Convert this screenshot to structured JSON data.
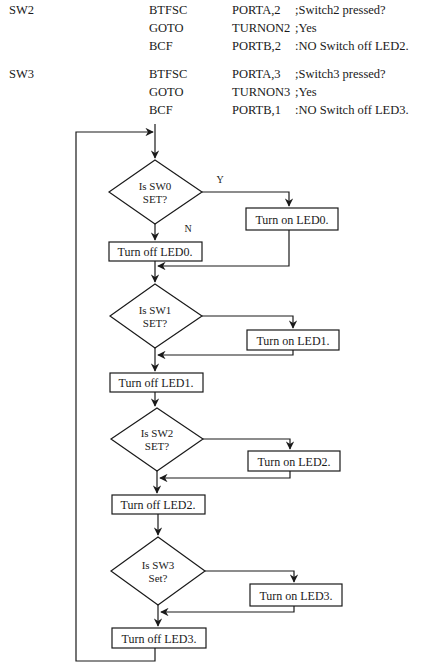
{
  "code": {
    "blocks": [
      {
        "label": "SW2",
        "lines": [
          {
            "op": "BTFSC",
            "arg": "PORTA,2",
            "comment": ";Switch2 pressed?"
          },
          {
            "op": "GOTO",
            "arg": "TURNON2",
            "comment": ";Yes"
          },
          {
            "op": "BCF",
            "arg": "PORTB,2",
            "comment": ":NO Switch off LED2."
          }
        ]
      },
      {
        "label": "SW3",
        "lines": [
          {
            "op": "BTFSC",
            "arg": "PORTA,3",
            "comment": ";Switch3 pressed?"
          },
          {
            "op": "GOTO",
            "arg": "TURNON3",
            "comment": ";Yes"
          },
          {
            "op": "BCF",
            "arg": "PORTB,1",
            "comment": ":NO Switch off LED3."
          }
        ]
      }
    ]
  },
  "flowchart": {
    "yes_label": "Y",
    "no_label": "N",
    "stages": [
      {
        "decision_line1": "Is SW0",
        "decision_line2": "SET?",
        "on_action": "Turn on LED0.",
        "off_action": "Turn off LED0."
      },
      {
        "decision_line1": "Is SW1",
        "decision_line2": "SET?",
        "on_action": "Turn on LED1.",
        "off_action": "Turn off LED1."
      },
      {
        "decision_line1": "Is SW2",
        "decision_line2": "SET?",
        "on_action": "Turn on LED2.",
        "off_action": "Turn off LED2."
      },
      {
        "decision_line1": "Is SW3",
        "decision_line2": "Set?",
        "on_action": "Turn on LED3.",
        "off_action": "Turn off LED3."
      }
    ]
  },
  "colors": {
    "line": "#1a1a1a",
    "background": "#ffffff"
  }
}
